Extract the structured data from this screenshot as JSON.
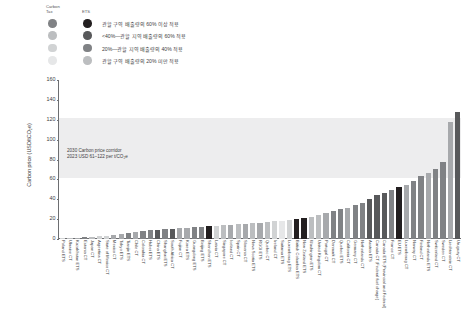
{
  "legend": {
    "head_carbon_tax": "Carbon\nTax",
    "head_ets": "ETS",
    "rows": [
      {
        "label": "관할 구역 배출량의 60% 이상 적용",
        "ct": "#808285",
        "ets": "#231f20"
      },
      {
        "label": "<40%—관할 지역 배출량의 60% 적용",
        "ct": "#bcbec0",
        "ets": "#58595b"
      },
      {
        "label": "20%—관할 지역 배출량의 40% 적용",
        "ct": "#d1d3d4",
        "ets": "#808285"
      },
      {
        "label": "관할 구역 배출량의 20% 미만 적용",
        "ct": "#e6e7e8",
        "ets": "#bcbec0"
      }
    ]
  },
  "chart_data": {
    "type": "bar",
    "title": "",
    "xlabel": "",
    "ylabel": "Carbon price (USD/tCO₂e)",
    "ylim": [
      0,
      160
    ],
    "yticks": [
      0,
      20,
      40,
      60,
      80,
      100,
      120,
      140,
      160
    ],
    "grid": false,
    "legend_position": "top-left",
    "annotations": [
      {
        "text": "2030 Carbon price corridor\n2023 USD 61–122 per t/CO₂e",
        "band_low": 61,
        "band_high": 122,
        "band_color": "#ededee"
      }
    ],
    "categories": [
      "Poland ETS",
      "Ukraine CT",
      "Kazakhstan ETS",
      "Estonia CT",
      "Japan CT",
      "Argentina CT",
      "State of Mexico CT",
      "Mexico CT",
      "Tokyo ETS",
      "Tianjin ETS",
      "Chile CT",
      "Colombia CT",
      "Hubei ETS",
      "China ETS",
      "Shanghai ETS",
      "South Africa CT",
      "Fujian CT",
      "Korea ETS",
      "Guangdong ETS",
      "Beijing ETS",
      "Shenzhen ETS",
      "Latvia CT",
      "Singapore CT",
      "Iceland CT",
      "Spain CT",
      "Slovenia CT",
      "Nova Scotia ETS",
      "RGGI ETS",
      "Quebec CT",
      "Ireland CT",
      "Saitama ETS",
      "Luxembourg ETS",
      "British Columbia ETS",
      "New Zealand ETS",
      "Washington ETS",
      "United Kingdom CT",
      "Portugal CT",
      "Denmark CT",
      "Quebec ETS",
      "California CT",
      "Germany CT",
      "Netherlands CT",
      "Austria ETS",
      "Canada CT (Federal fuel charge)",
      "Canada ETS (Provincial and Federal)",
      "France CT",
      "EU ETS",
      "Luxembourg CT",
      "Norway CT",
      "Finland CT",
      "Netherlands ETS",
      "Switzerland CT",
      "Sweden CT",
      "Liechtenstein CT",
      "Uruguay CT"
    ],
    "values": [
      1,
      1,
      1,
      2,
      2,
      3,
      3,
      4,
      5,
      6,
      7,
      8,
      9,
      9,
      10,
      10,
      11,
      11,
      12,
      12,
      13,
      13,
      14,
      14,
      15,
      15,
      16,
      16,
      17,
      18,
      18,
      19,
      20,
      21,
      22,
      24,
      26,
      28,
      30,
      31,
      34,
      36,
      40,
      44,
      46,
      49,
      52,
      54,
      58,
      63,
      66,
      70,
      78,
      118,
      128
    ],
    "bar_colors": [
      "#d1d3d4",
      "#bcbec0",
      "#a7a9ac",
      "#808285",
      "#bcbec0",
      "#d1d3d4",
      "#d1d3d4",
      "#a7a9ac",
      "#a7a9ac",
      "#808285",
      "#a7a9ac",
      "#808285",
      "#808285",
      "#58595b",
      "#808285",
      "#58595b",
      "#a7a9ac",
      "#a7a9ac",
      "#808285",
      "#808285",
      "#231f20",
      "#d1d3d4",
      "#bcbec0",
      "#a7a9ac",
      "#bcbec0",
      "#a7a9ac",
      "#bcbec0",
      "#a7a9ac",
      "#bcbec0",
      "#d1d3d4",
      "#e6e7e8",
      "#d1d3d4",
      "#231f20",
      "#231f20",
      "#bcbec0",
      "#bcbec0",
      "#a7a9ac",
      "#808285",
      "#808285",
      "#a7a9ac",
      "#808285",
      "#808285",
      "#58595b",
      "#58595b",
      "#58595b",
      "#808285",
      "#231f20",
      "#a7a9ac",
      "#808285",
      "#808285",
      "#a7a9ac",
      "#808285",
      "#808285",
      "#a7a9ac",
      "#58595b"
    ]
  }
}
